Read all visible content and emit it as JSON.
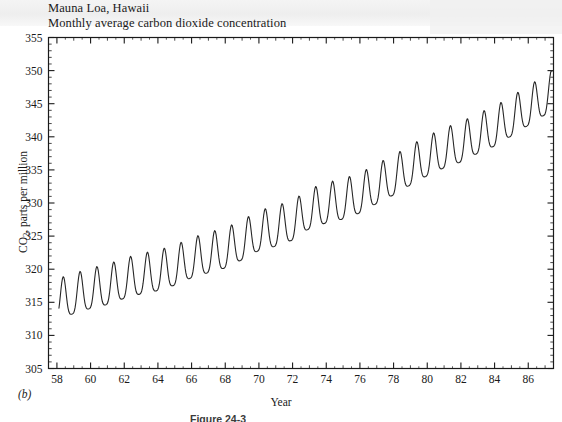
{
  "figure": {
    "title_line1": "Mauna Loa, Hawaii",
    "title_line2": "Monthly average carbon dioxide concentration",
    "panel_label": "(b)",
    "caption": "Figure 24-3",
    "axis_color": "#1a1a1a",
    "curve_color": "#262626"
  },
  "chart_data": {
    "type": "line",
    "xlabel": "Year",
    "ylabel": "CO2, parts per million",
    "xlim": [
      57.5,
      87.5
    ],
    "ylim": [
      305,
      355
    ],
    "ytick_step": 5,
    "xtick_step": 2,
    "yticks": [
      305,
      310,
      315,
      320,
      325,
      330,
      335,
      340,
      345,
      350,
      355
    ],
    "xticks": [
      58,
      60,
      62,
      64,
      66,
      68,
      70,
      72,
      74,
      76,
      78,
      80,
      82,
      84,
      86
    ],
    "grid": false,
    "legend": "none",
    "minor_ticks_x_per_major": 2,
    "minor_ticks_y_per_major": 5,
    "seasonal_amplitude": 3.1,
    "seasonal_peak_month": 5,
    "series": [
      {
        "name": "Monthly average CO2 concentration",
        "x_start": 58.12,
        "x_end": 87.45,
        "annual_baseline_years": [
          58,
          59,
          60,
          61,
          62,
          63,
          64,
          65,
          66,
          67,
          68,
          69,
          70,
          71,
          72,
          73,
          74,
          75,
          76,
          77,
          78,
          79,
          80,
          81,
          82,
          83,
          84,
          85,
          86,
          87
        ],
        "annual_baseline_values": [
          315.0,
          315.8,
          316.6,
          317.2,
          318.1,
          318.8,
          319.3,
          320.1,
          321.2,
          322.0,
          322.7,
          323.9,
          325.3,
          326.0,
          326.9,
          328.6,
          329.5,
          330.1,
          331.0,
          332.4,
          333.7,
          335.2,
          336.6,
          337.8,
          338.7,
          340.0,
          341.1,
          342.6,
          344.2,
          345.8
        ]
      }
    ]
  }
}
